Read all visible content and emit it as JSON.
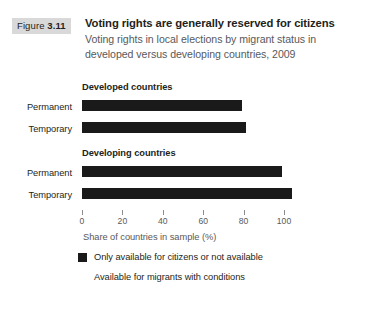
{
  "figure": {
    "badge_word": "Figure",
    "badge_number": "3.11",
    "title": "Voting rights are generally reserved for citizens",
    "subtitle_line1": "Voting rights in local elections by migrant status in",
    "subtitle_line2": "developed versus developing countries, 2009",
    "badge_background": "#d9d9d9",
    "bar_color": "#1a1a1a",
    "subtitle_color": "#58595b"
  },
  "groups": [
    {
      "heading": "Developed countries",
      "rows": [
        {
          "label": "Permanent",
          "value": 79
        },
        {
          "label": "Temporary",
          "value": 81
        }
      ]
    },
    {
      "heading": "Developing countries",
      "rows": [
        {
          "label": "Permanent",
          "value": 99
        },
        {
          "label": "Temporary",
          "value": 104
        }
      ]
    }
  ],
  "axis": {
    "title": "Share of countries in sample (%)",
    "ticks": [
      "0",
      "20",
      "40",
      "60",
      "80",
      "100"
    ],
    "min": 0,
    "max": 100
  },
  "legend": [
    {
      "label": "Only available for citizens or not available",
      "color": "#1a1a1a"
    },
    {
      "label": "Available for migrants with conditions",
      "color": "#ffffff"
    }
  ],
  "chart_data": {
    "type": "bar",
    "orientation": "horizontal",
    "title": "Voting rights are generally reserved for citizens",
    "subtitle": "Voting rights in local elections by migrant status in developed versus developing countries, 2009",
    "xlabel": "Share of countries in sample (%)",
    "ylabel": "",
    "xlim": [
      0,
      100
    ],
    "xticks": [
      0,
      20,
      40,
      60,
      80,
      100
    ],
    "grid": false,
    "legend_position": "bottom-left",
    "categories": [
      "Developed countries - Permanent",
      "Developed countries - Temporary",
      "Developing countries - Permanent",
      "Developing countries - Temporary"
    ],
    "values": [
      79,
      81,
      99,
      104
    ],
    "series": [
      {
        "name": "Only available for citizens or not available",
        "color": "#1a1a1a",
        "values": [
          79,
          81,
          99,
          104
        ]
      },
      {
        "name": "Available for migrants with conditions",
        "color": "#ffffff",
        "values": [
          21,
          19,
          1,
          0
        ]
      }
    ],
    "groups": [
      {
        "name": "Developed countries",
        "categories": [
          "Permanent",
          "Temporary"
        ],
        "values": [
          79,
          81
        ]
      },
      {
        "name": "Developing countries",
        "categories": [
          "Permanent",
          "Temporary"
        ],
        "values": [
          99,
          104
        ]
      }
    ]
  }
}
